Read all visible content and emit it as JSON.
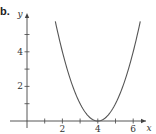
{
  "figure": {
    "part_label": "b."
  },
  "chart_data": {
    "type": "line",
    "title": "",
    "xlabel": "x",
    "ylabel": "y",
    "xlim": [
      0,
      7
    ],
    "ylim": [
      0,
      6
    ],
    "grid": false,
    "x_ticks": [
      1,
      2,
      3,
      4,
      5,
      6
    ],
    "x_tick_labels": [
      "",
      "2",
      "",
      "4",
      "",
      "6"
    ],
    "y_ticks": [
      1,
      2,
      3,
      4,
      5
    ],
    "y_tick_labels": [
      "",
      "2",
      "",
      "4",
      ""
    ],
    "series": [
      {
        "name": "y = (x - 4)^2",
        "color": "#555555",
        "x": [
          1.6,
          2,
          2.5,
          3,
          3.5,
          4,
          4.5,
          5,
          5.5,
          6,
          6.4
        ],
        "y": [
          5.76,
          4,
          2.25,
          1,
          0.25,
          0,
          0.25,
          1,
          2.25,
          4,
          5.76
        ]
      }
    ]
  }
}
